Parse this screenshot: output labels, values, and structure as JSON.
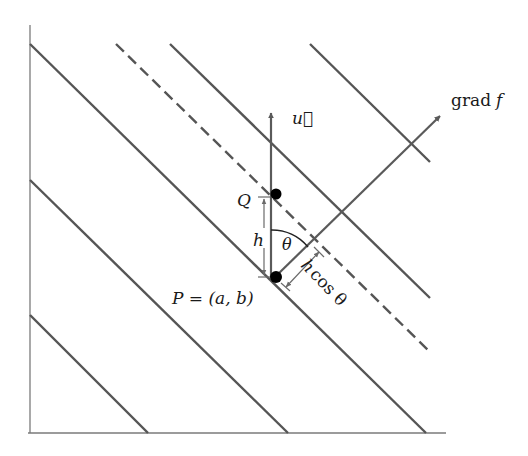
{
  "diagram": {
    "labels": {
      "u_vector": "u⃗",
      "grad": "grad",
      "grad_f": "f",
      "point_q": "Q",
      "point_p": "P = (a, b)",
      "h": "h",
      "theta": "θ",
      "h_cos": "h",
      "cos_theta": "cos θ"
    },
    "elements": {
      "level_curves_solid": 5,
      "level_curves_dashed": 1,
      "points": [
        "P",
        "Q"
      ],
      "vectors": [
        "u",
        "grad f"
      ]
    },
    "colors": {
      "line": "#555555",
      "axis": "#777777",
      "point": "#000000"
    }
  }
}
